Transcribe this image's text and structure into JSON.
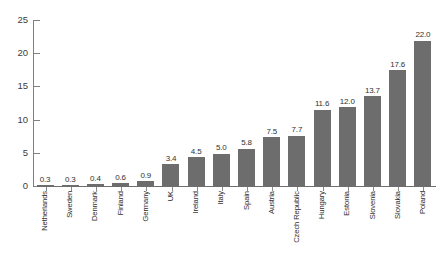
{
  "chart_data": {
    "type": "bar",
    "title": "",
    "subtitle": "",
    "xlabel": "",
    "ylabel": "",
    "ylim": [
      0,
      25
    ],
    "yticks": [
      0,
      5,
      10,
      15,
      20,
      25
    ],
    "ytick_labels": [
      "0",
      "5",
      "10",
      "15",
      "20",
      "25"
    ],
    "grid": false,
    "legend": null,
    "categories": [
      "Netherlands",
      "Sweden",
      "Denmark",
      "Finland",
      "Germany",
      "UK",
      "Ireland",
      "Italy",
      "Spain",
      "Austria",
      "Czech Republic",
      "Hungary",
      "Estonia",
      "Slovenia",
      "Slovakia",
      "Poland"
    ],
    "values": [
      0.3,
      0.3,
      0.4,
      0.6,
      0.9,
      3.4,
      4.5,
      5.0,
      5.8,
      7.5,
      7.7,
      11.6,
      12.0,
      13.7,
      17.6,
      22.0
    ],
    "value_labels": [
      "0.3",
      "0.3",
      "0.4",
      "0.6",
      "0.9",
      "3.4",
      "4.5",
      "5.0",
      "5.8",
      "7.5",
      "7.7",
      "11.6",
      "12.0",
      "13.7",
      "17.6",
      "22.0"
    ],
    "bar_color": "#6d6d6d",
    "axis_color": "#808080",
    "text_color": "#2e2e2e",
    "background": "#ffffff"
  }
}
